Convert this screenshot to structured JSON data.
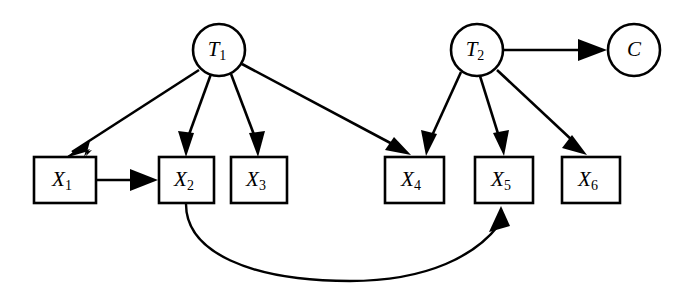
{
  "diagram": {
    "type": "directed-graph",
    "title": "",
    "background_color": "#ffffff",
    "stroke_color": "#000000",
    "nodes": [
      {
        "id": "T1",
        "label": "T",
        "subscript": "1",
        "shape": "circle",
        "cx": 219,
        "cy": 50,
        "r": 26
      },
      {
        "id": "T2",
        "label": "T",
        "subscript": "2",
        "shape": "circle",
        "cx": 477,
        "cy": 50,
        "r": 26
      },
      {
        "id": "C",
        "label": "C",
        "subscript": "",
        "shape": "circle",
        "cx": 634,
        "cy": 50,
        "r": 26
      },
      {
        "id": "X1",
        "label": "X",
        "subscript": "1",
        "shape": "rect",
        "x": 34,
        "y": 157,
        "w": 62,
        "h": 46
      },
      {
        "id": "X2",
        "label": "X",
        "subscript": "2",
        "shape": "rect",
        "x": 159,
        "y": 157,
        "w": 55,
        "h": 46
      },
      {
        "id": "X3",
        "label": "X",
        "subscript": "3",
        "shape": "rect",
        "x": 231,
        "y": 157,
        "w": 56,
        "h": 46
      },
      {
        "id": "X4",
        "label": "X",
        "subscript": "4",
        "shape": "rect",
        "x": 385,
        "y": 157,
        "w": 59,
        "h": 46
      },
      {
        "id": "X5",
        "label": "X",
        "subscript": "5",
        "shape": "rect",
        "x": 475,
        "y": 157,
        "w": 58,
        "h": 46
      },
      {
        "id": "X6",
        "label": "X",
        "subscript": "6",
        "shape": "rect",
        "x": 562,
        "y": 157,
        "w": 58,
        "h": 46
      }
    ],
    "edges": [
      {
        "from": "T1",
        "to": "X1",
        "style": "straight"
      },
      {
        "from": "T1",
        "to": "X2",
        "style": "straight"
      },
      {
        "from": "T1",
        "to": "X3",
        "style": "straight"
      },
      {
        "from": "T1",
        "to": "X4",
        "style": "straight"
      },
      {
        "from": "T2",
        "to": "X4",
        "style": "straight"
      },
      {
        "from": "T2",
        "to": "X5",
        "style": "straight"
      },
      {
        "from": "T2",
        "to": "X6",
        "style": "straight"
      },
      {
        "from": "T2",
        "to": "C",
        "style": "straight"
      },
      {
        "from": "X1",
        "to": "X2",
        "style": "straight"
      },
      {
        "from": "X2",
        "to": "X5",
        "style": "curved"
      }
    ]
  }
}
